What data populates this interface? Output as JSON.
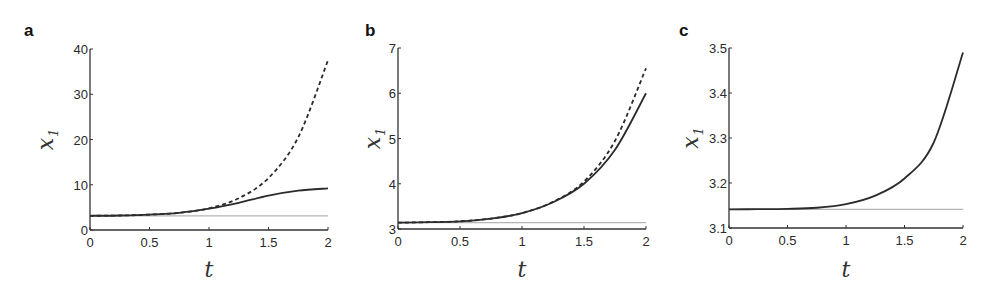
{
  "chart_data": [
    {
      "panel": "a",
      "type": "line",
      "title": "",
      "xlabel": "t",
      "ylabel": "x_1",
      "xlim": [
        0,
        2
      ],
      "ylim": [
        0,
        40
      ],
      "xticks": [
        "0",
        "0.5",
        "1",
        "1.5",
        "2"
      ],
      "yticks": [
        "0",
        "10",
        "20",
        "30",
        "40"
      ],
      "grid": false,
      "x": [
        0,
        0.25,
        0.5,
        0.75,
        1.0,
        1.25,
        1.5,
        1.75,
        2.0
      ],
      "series": [
        {
          "name": "dashed",
          "style": "dashed",
          "color": "#2b2b2b",
          "values": [
            3.14,
            3.2,
            3.4,
            3.8,
            4.8,
            7.0,
            11.5,
            20.5,
            37.5
          ]
        },
        {
          "name": "solid",
          "style": "solid",
          "color": "#2b2b2b",
          "values": [
            3.14,
            3.2,
            3.4,
            3.8,
            4.7,
            6.0,
            7.6,
            8.7,
            9.2
          ]
        },
        {
          "name": "reference",
          "style": "solid",
          "color": "#b5b5b5",
          "values": [
            3.14,
            3.14,
            3.14,
            3.14,
            3.14,
            3.14,
            3.14,
            3.14,
            3.14
          ]
        }
      ]
    },
    {
      "panel": "b",
      "type": "line",
      "title": "",
      "xlabel": "t",
      "ylabel": "x_1",
      "xlim": [
        0,
        2
      ],
      "ylim": [
        3,
        7
      ],
      "xticks": [
        "0",
        "0.5",
        "1",
        "1.5",
        "2"
      ],
      "yticks": [
        "3",
        "4",
        "5",
        "6",
        "7"
      ],
      "grid": false,
      "x": [
        0,
        0.25,
        0.5,
        0.75,
        1.0,
        1.25,
        1.5,
        1.75,
        2.0
      ],
      "series": [
        {
          "name": "dashed",
          "style": "dashed",
          "color": "#2b2b2b",
          "values": [
            3.14,
            3.15,
            3.17,
            3.23,
            3.35,
            3.6,
            4.05,
            4.95,
            6.55
          ]
        },
        {
          "name": "solid",
          "style": "solid",
          "color": "#2b2b2b",
          "values": [
            3.14,
            3.15,
            3.17,
            3.23,
            3.35,
            3.59,
            4.0,
            4.75,
            6.0
          ]
        },
        {
          "name": "reference",
          "style": "solid",
          "color": "#b5b5b5",
          "values": [
            3.14,
            3.14,
            3.14,
            3.14,
            3.14,
            3.14,
            3.14,
            3.14,
            3.14
          ]
        }
      ]
    },
    {
      "panel": "c",
      "type": "line",
      "title": "",
      "xlabel": "t",
      "ylabel": "x_1",
      "xlim": [
        0,
        2
      ],
      "ylim": [
        3.1,
        3.5
      ],
      "xticks": [
        "0",
        "0.5",
        "1",
        "1.5",
        "2"
      ],
      "yticks": [
        "3.1",
        "3.2",
        "3.3",
        "3.4",
        "3.5"
      ],
      "grid": false,
      "x": [
        0,
        0.25,
        0.5,
        0.75,
        1.0,
        1.25,
        1.5,
        1.75,
        2.0
      ],
      "series": [
        {
          "name": "solid",
          "style": "solid",
          "color": "#2b2b2b",
          "values": [
            3.1416,
            3.1418,
            3.1425,
            3.145,
            3.153,
            3.172,
            3.21,
            3.29,
            3.49
          ]
        },
        {
          "name": "reference",
          "style": "solid",
          "color": "#b5b5b5",
          "values": [
            3.1416,
            3.1416,
            3.1416,
            3.1416,
            3.1416,
            3.1416,
            3.1416,
            3.1416,
            3.1416
          ]
        }
      ]
    }
  ],
  "layout": [
    {
      "x0": 90,
      "x1": 328,
      "y0": 230,
      "y1": 49,
      "label_x": 24,
      "label_y": 36,
      "ylabel_x": 45
    },
    {
      "x0": 398,
      "x1": 646,
      "y0": 229,
      "y1": 48,
      "label_x": 365,
      "label_y": 36,
      "ylabel_x": 372
    },
    {
      "x0": 729,
      "x1": 963,
      "y0": 228,
      "y1": 48,
      "label_x": 679,
      "label_y": 36,
      "ylabel_x": 690
    }
  ]
}
